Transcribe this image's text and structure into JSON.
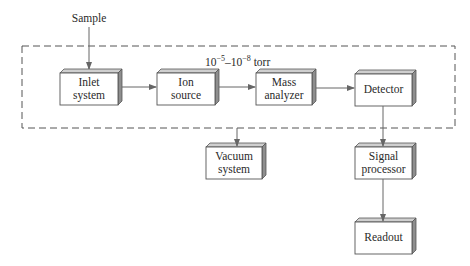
{
  "diagram": {
    "input_label": "Sample",
    "pressure_label_prefix": "10",
    "pressure_exp1": "−5",
    "pressure_dash": "–10",
    "pressure_exp2": "−8",
    "pressure_unit": " torr",
    "blocks": {
      "inlet": {
        "line1": "Inlet",
        "line2": "system"
      },
      "ion_source": {
        "line1": "Ion",
        "line2": "source"
      },
      "mass_analyzer": {
        "line1": "Mass",
        "line2": "analyzer"
      },
      "detector": {
        "line1": "Detector"
      },
      "vacuum": {
        "line1": "Vacuum",
        "line2": "system"
      },
      "signal_processor": {
        "line1": "Signal",
        "line2": "processor"
      },
      "readout": {
        "line1": "Readout"
      }
    },
    "colors": {
      "line": "#555555",
      "box_fill": "#ffffff",
      "box_side": "#9a9a9a",
      "text": "#2a2a2a"
    }
  }
}
